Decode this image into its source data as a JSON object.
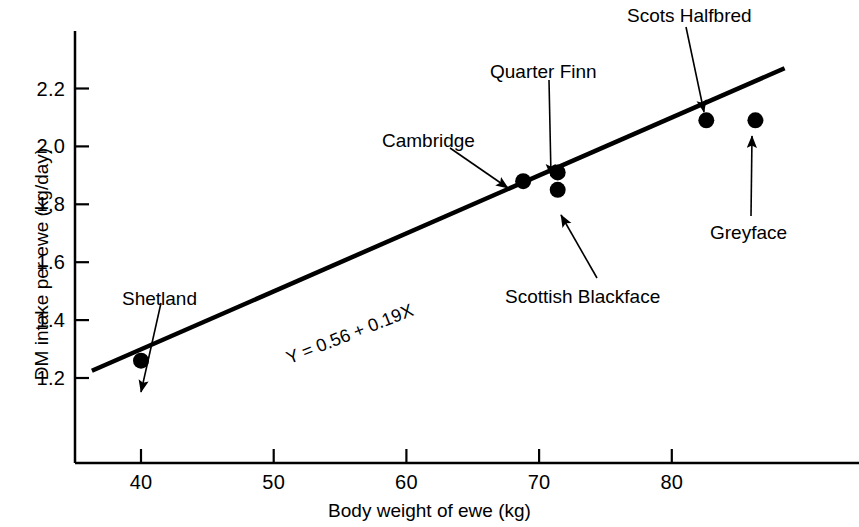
{
  "chart_data": {
    "type": "scatter",
    "title": "",
    "xlabel": "Body weight of ewe (kg)",
    "ylabel": "DM intake per ewe (kg/day)",
    "xlim": [
      35,
      90
    ],
    "ylim": [
      1.1,
      2.32
    ],
    "grid": false,
    "legend": "none",
    "xticks": [
      40,
      50,
      60,
      70,
      80
    ],
    "xtick_labels": [
      "40",
      "50",
      "60",
      "70",
      "80"
    ],
    "yticks": [
      1.2,
      1.4,
      1.6,
      1.8,
      2.0,
      2.2
    ],
    "ytick_labels": [
      "1.2",
      "1.4",
      "1.6",
      "1.8",
      "2.0",
      "2.2"
    ],
    "points": [
      {
        "label": "Shetland",
        "x": 40.0,
        "y": 1.26
      },
      {
        "label": "Cambridge",
        "x": 68.8,
        "y": 1.88
      },
      {
        "label": "Quarter Finn",
        "x": 71.4,
        "y": 1.91
      },
      {
        "label": "Scottish Blackface",
        "x": 71.4,
        "y": 1.85
      },
      {
        "label": "Scots Halfbred",
        "x": 82.6,
        "y": 2.09
      },
      {
        "label": "Greyface",
        "x": 86.3,
        "y": 2.09
      }
    ],
    "fit_line": {
      "equation": "Y = 0.56 + 0.19X",
      "intercept": 0.56,
      "slope": 0.019,
      "x_start": 36.3,
      "y_start": 1.225,
      "x_end": 88.5,
      "y_end": 2.27
    },
    "annotations": [
      {
        "text": "Shetland",
        "label_x": 122,
        "label_y": 288,
        "arrow_from_x": 161,
        "arrow_from_y": 303,
        "arrow_to_x": 141,
        "arrow_to_y": 392
      },
      {
        "text": "Cambridge",
        "label_x": 382,
        "label_y": 130,
        "arrow_from_x": 450,
        "arrow_from_y": 148,
        "arrow_to_x": 508,
        "arrow_to_y": 188
      },
      {
        "text": "Quarter Finn",
        "label_x": 490,
        "label_y": 61,
        "arrow_from_x": 549,
        "arrow_from_y": 80,
        "arrow_to_x": 551,
        "arrow_to_y": 176
      },
      {
        "text": "Scottish Blackface",
        "label_x": 505,
        "label_y": 286,
        "arrow_from_x": 597,
        "arrow_from_y": 278,
        "arrow_to_x": 561,
        "arrow_to_y": 215
      },
      {
        "text": "Scots Halfbred",
        "label_x": 627,
        "label_y": 5,
        "arrow_from_x": 686,
        "arrow_from_y": 27,
        "arrow_to_x": 704,
        "arrow_to_y": 112
      },
      {
        "text": "Greyface",
        "label_x": 710,
        "label_y": 222,
        "arrow_from_x": 751,
        "arrow_from_y": 216,
        "arrow_to_x": 752,
        "arrow_to_y": 136
      }
    ],
    "equation_label": {
      "text": "Y = 0.56 + 0.19X",
      "x": 291,
      "y": 348,
      "rotation_deg": -21.5
    },
    "marker": {
      "shape": "circle",
      "radius_px": 8,
      "color": "#000000"
    },
    "line_color": "#000000",
    "axis_color": "#000000",
    "background_color": "#ffffff"
  },
  "axes_geometry": {
    "x_pixel_at_40": 141,
    "x_pixel_per_unit": 13.27,
    "y_pixel_at_1_2": 378,
    "y_pixel_per_unit": 289.5,
    "axis_left_px": 75,
    "axis_bottom_px": 463,
    "axis_top_px": 31,
    "axis_right_px": 859
  }
}
